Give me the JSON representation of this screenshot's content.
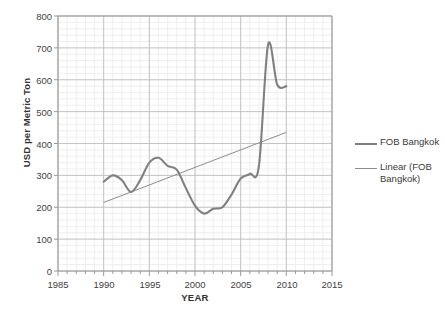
{
  "chart_data": {
    "type": "line",
    "title": "",
    "xlabel": "YEAR",
    "ylabel": "USD per Metric Ton",
    "xlim": [
      1985,
      2015
    ],
    "ylim": [
      0,
      800
    ],
    "xticks": [
      1985,
      1990,
      1995,
      2000,
      2005,
      2010,
      2015
    ],
    "yticks": [
      0,
      100,
      200,
      300,
      400,
      500,
      600,
      700,
      800
    ],
    "grid": "major and minor gridlines, light gray",
    "legend_position": "right",
    "series": [
      {
        "name": "FOB Bangkok",
        "color": "#808080",
        "x": [
          1990,
          1991,
          1992,
          1993,
          1994,
          1995,
          1996,
          1997,
          1998,
          1999,
          2000,
          2001,
          2002,
          2003,
          2004,
          2005,
          2006,
          2007,
          2008,
          2009,
          2010
        ],
        "values": [
          280,
          300,
          285,
          248,
          285,
          340,
          355,
          330,
          318,
          260,
          205,
          180,
          195,
          200,
          240,
          290,
          305,
          330,
          710,
          585,
          580
        ]
      },
      {
        "name": "Linear (FOB Bangkok)",
        "color": "#8c8c8c",
        "type": "trendline",
        "x": [
          1990,
          2010
        ],
        "values": [
          215,
          435
        ]
      }
    ]
  },
  "axes": {
    "y_tick_labels": [
      "800",
      "700",
      "600",
      "500",
      "400",
      "300",
      "200",
      "100",
      "0"
    ],
    "x_tick_labels": [
      "1985",
      "1990",
      "1995",
      "2000",
      "2005",
      "2010",
      "2015"
    ],
    "y_axis_title": "USD per Metric Ton",
    "x_axis_title": "YEAR"
  },
  "legend": {
    "items": [
      {
        "label": "FOB Bangkok",
        "color": "#808080"
      },
      {
        "label": "Linear (FOB Bangkok)",
        "color": "#8c8c8c"
      }
    ]
  },
  "colors": {
    "series_line": "#808080",
    "trend_line": "#8c8c8c",
    "major_grid": "#bfbfbf",
    "minor_grid": "#e8e8e8",
    "axis": "#9a9a9a",
    "text": "#3a3a3a"
  }
}
